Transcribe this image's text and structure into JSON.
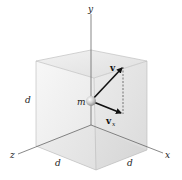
{
  "figure": {
    "type": "3D cube with velocity vector",
    "axes": {
      "x": "x",
      "y": "y",
      "z": "z"
    },
    "dimension_labels": [
      "d",
      "d",
      "d"
    ],
    "mass_label": "m",
    "vectors": {
      "velocity": "v",
      "component_base": "v",
      "component_subscript": "x"
    },
    "colors": {
      "cube_top": "#e6e6e6",
      "cube_left": "#efefef",
      "cube_right": "#dcdcdc",
      "cube_floor": "#d8d8d8",
      "axis": "#555555",
      "vector": "#111111",
      "sphere": "#bdbdbd"
    }
  }
}
